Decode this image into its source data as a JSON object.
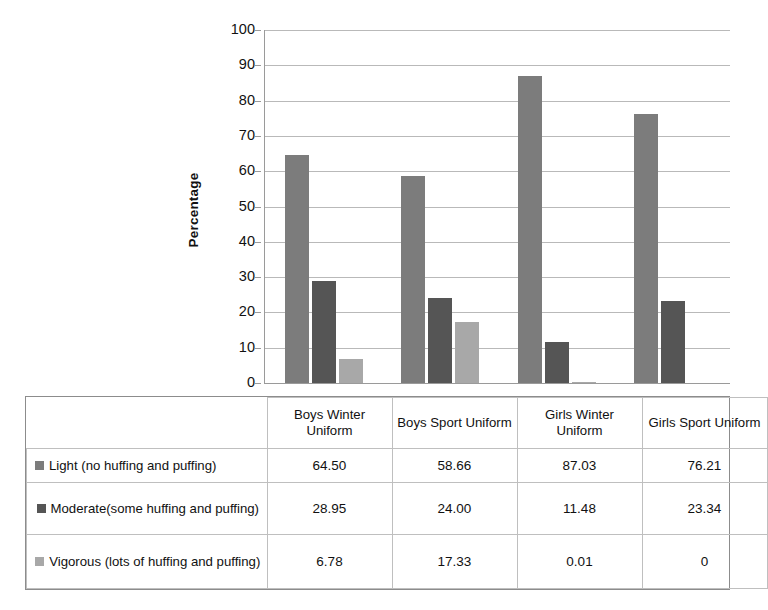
{
  "chart_data": {
    "type": "bar",
    "title": "",
    "xlabel": "",
    "ylabel": "Percentage",
    "ylim": [
      0,
      100
    ],
    "ytick_step": 10,
    "yticks": [
      100,
      90,
      80,
      70,
      60,
      50,
      40,
      30,
      20,
      10,
      0
    ],
    "grid": true,
    "legend_position": "data-table-left",
    "categories": [
      "Boys Winter Uniform",
      "Boys Sport Uniform",
      "Girls Winter Uniform",
      "Girls Sport Uniform"
    ],
    "series": [
      {
        "name": "Light (no huffing and puffing)",
        "color": "#7c7c7c",
        "values": [
          64.5,
          58.66,
          87.03,
          76.21
        ],
        "labels": [
          "64.50",
          "58.66",
          "87.03",
          "76.21"
        ]
      },
      {
        "name": "Moderate(some huffing and puffing)",
        "color": "#555555",
        "values": [
          28.95,
          24.0,
          11.48,
          23.34
        ],
        "labels": [
          "28.95",
          "24.00",
          "11.48",
          "23.34"
        ]
      },
      {
        "name": "Vigorous (lots of huffing and puffing)",
        "color": "#a8a8a8",
        "values": [
          6.78,
          17.33,
          0.01,
          0
        ],
        "labels": [
          "6.78",
          "17.33",
          "0.01",
          "0"
        ]
      }
    ]
  },
  "table": {
    "corner_label": "",
    "column_headers": [
      "Boys Winter Uniform",
      "Boys Sport Uniform",
      "Girls Winter Uniform",
      "Girls Sport Uniform"
    ],
    "rows": [
      {
        "label": "Light (no huffing and puffing)",
        "swatch_color": "#7c7c7c",
        "cells": [
          "64.50",
          "58.66",
          "87.03",
          "76.21"
        ]
      },
      {
        "label": "Moderate(some huffing and puffing)",
        "swatch_color": "#555555",
        "cells": [
          "28.95",
          "24.00",
          "11.48",
          "23.34"
        ]
      },
      {
        "label": "Vigorous (lots of huffing and puffing)",
        "swatch_color": "#a8a8a8",
        "cells": [
          "6.78",
          "17.33",
          "0.01",
          "0"
        ]
      }
    ]
  }
}
